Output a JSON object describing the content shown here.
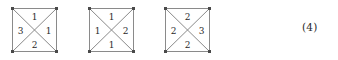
{
  "figure": {
    "background_color": "#ffffff",
    "line_color": "#8a8a8a",
    "corner_marker_color": "#4a4a4a",
    "text_color": "#2a2a2a",
    "squares": [
      {
        "id": "square-1",
        "x": 11,
        "labels": {
          "top": "1",
          "left": "3",
          "right": "1",
          "bottom": "2"
        }
      },
      {
        "id": "square-2",
        "x": 88,
        "labels": {
          "top": "1",
          "left": "1",
          "right": "2",
          "bottom": "1"
        }
      },
      {
        "id": "square-3",
        "x": 164,
        "labels": {
          "top": "2",
          "left": "2",
          "right": "3",
          "bottom": "2"
        }
      }
    ],
    "equation_number": "(4)"
  }
}
